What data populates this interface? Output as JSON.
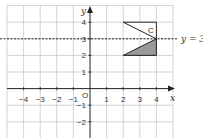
{
  "diagram": {
    "axes": {
      "x_label": "x",
      "y_label": "y",
      "origin_label": "O",
      "x_ticks": [
        "−4",
        "−3",
        "−2",
        "−1",
        "1",
        "2",
        "3",
        "4"
      ],
      "y_ticks": [
        "4",
        "3",
        "2",
        "1",
        "−1",
        "−2"
      ]
    },
    "mirror_line": {
      "label": "y = 3",
      "equation": "y = 3"
    },
    "shape_c": {
      "label": "C",
      "vertices": [
        [
          2,
          4
        ],
        [
          4,
          4
        ],
        [
          4,
          3
        ]
      ]
    },
    "shape_image": {
      "vertices": [
        [
          2,
          2
        ],
        [
          4,
          2
        ],
        [
          4,
          3
        ]
      ],
      "fill": "#999999"
    },
    "colors": {
      "grid": "#cccccc",
      "axis": "#222222",
      "shaded": "#9a9a9a"
    }
  }
}
